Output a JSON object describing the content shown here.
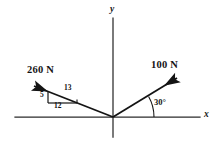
{
  "figure": {
    "kind": "force-vector-diagram",
    "width": 221,
    "height": 141,
    "background_color": "#ffffff",
    "stroke_color": "#1a1a1a",
    "axis_color": "#2b2b2b"
  },
  "axes": {
    "x_label": "x",
    "y_label": "y",
    "origin": {
      "x": 113,
      "y": 117
    },
    "x_axis": {
      "x1": 15,
      "y1": 117,
      "x2": 200,
      "y2": 117
    },
    "y_axis": {
      "x1": 113,
      "y1": 18,
      "x2": 113,
      "y2": 137
    }
  },
  "vectors": [
    {
      "name": "force-260",
      "label": "260 N",
      "magnitude": 260,
      "unit": "N",
      "direction": "up-left",
      "tail": {
        "x": 113,
        "y": 117
      },
      "tip": {
        "x": 31,
        "y": 85
      },
      "slope_triangle": {
        "hypotenuse_label": "13",
        "vertical_label": "5",
        "horizontal_label": "12"
      }
    },
    {
      "name": "force-100",
      "label": "100 N",
      "magnitude": 100,
      "unit": "N",
      "direction": "up-right",
      "tail": {
        "x": 113,
        "y": 117
      },
      "tip": {
        "x": 180,
        "y": 76
      },
      "angle_label": "30°",
      "angle_value": 30,
      "angle_reference": "positive x-axis"
    }
  ],
  "annotations": {
    "triangle_hypotenuse": "13",
    "triangle_vertical": "5",
    "triangle_horizontal": "12",
    "angle": "30°"
  }
}
